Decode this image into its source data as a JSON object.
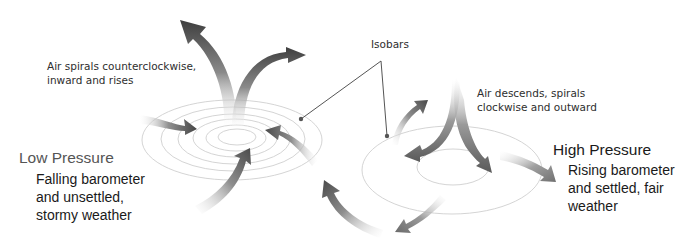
{
  "diagram": {
    "low_pressure": {
      "title": "Low Pressure",
      "description_lines": [
        "Falling barometer",
        "and unsettled,",
        "stormy weather"
      ],
      "airflow_note_lines": [
        "Air spirals counterclockwise,",
        "inward and rises"
      ]
    },
    "high_pressure": {
      "title": "High Pressure",
      "description_lines": [
        "Rising barometer",
        "and settled, fair",
        "weather"
      ],
      "airflow_note_lines": [
        "Air descends, spirals",
        "clockwise and outward"
      ]
    },
    "isobars_label": "Isobars",
    "colors": {
      "arrow_dark": "#4a4a4a",
      "arrow_light": "#e6e6e6",
      "isobar_line": "#cfcfcf",
      "leader_line": "#555555",
      "text": "#1a1a1a",
      "title_low": "#555555"
    }
  }
}
